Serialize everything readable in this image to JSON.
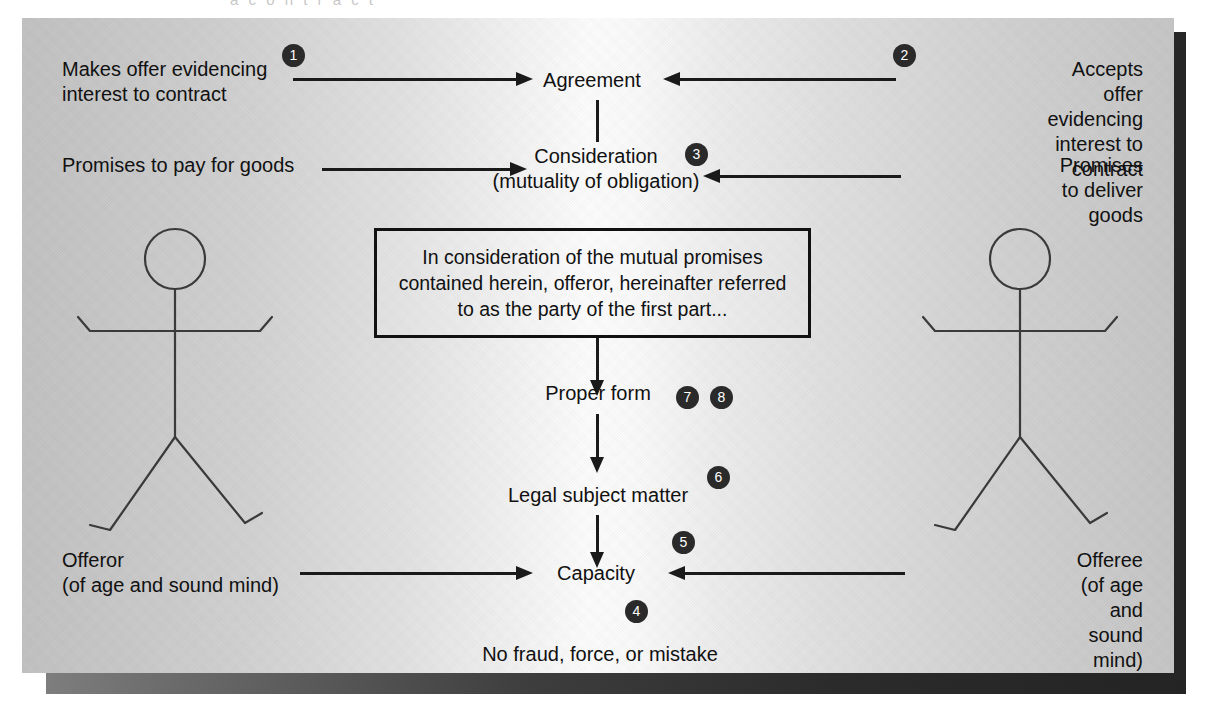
{
  "diagram": {
    "cutoff_text": "a  c  o  n  t  r  a  c  t",
    "center_nodes": [
      {
        "id": "agreement",
        "label": "Agreement"
      },
      {
        "id": "consideration",
        "label": "Consideration\n(mutuality of obligation)"
      },
      {
        "id": "proper-form",
        "label": "Proper form"
      },
      {
        "id": "legal-subject-matter",
        "label": "Legal subject matter"
      },
      {
        "id": "capacity",
        "label": "Capacity"
      },
      {
        "id": "no-fraud",
        "label": "No fraud, force, or mistake"
      }
    ],
    "left_labels": [
      {
        "id": "makes-offer",
        "label": "Makes offer evidencing\ninterest to contract"
      },
      {
        "id": "promises-to-pay",
        "label": "Promises to pay for goods"
      },
      {
        "id": "offeror",
        "label": "Offeror\n(of age and sound mind)"
      }
    ],
    "right_labels": [
      {
        "id": "accepts-offer",
        "label": "Accepts offer evidencing\ninterest to contract"
      },
      {
        "id": "promises-to-deliver",
        "label": "Promises to deliver goods"
      },
      {
        "id": "offeree",
        "label": "Offeree\n(of age and sound mind)"
      }
    ],
    "contract_box": {
      "text": "In consideration of the mutual promises\ncontained herein, offeror, hereinafter referred\nto as the party of the first part..."
    },
    "badges": [
      {
        "id": "badge-1",
        "number": "1"
      },
      {
        "id": "badge-2",
        "number": "2"
      },
      {
        "id": "badge-3",
        "number": "3"
      },
      {
        "id": "badge-4",
        "number": "4"
      },
      {
        "id": "badge-5",
        "number": "5"
      },
      {
        "id": "badge-6",
        "number": "6"
      },
      {
        "id": "badge-7",
        "number": "7"
      },
      {
        "id": "badge-8",
        "number": "8"
      }
    ],
    "figures": [
      {
        "id": "offeror-figure",
        "side": "left"
      },
      {
        "id": "offeree-figure",
        "side": "right"
      }
    ],
    "colors": {
      "ink": "#111111",
      "badge_fill": "#2a2a2a",
      "badge_text": "#ffffff",
      "panel_light": "#fdfdfd",
      "panel_dark": "#c2c2c2",
      "shadow": "#2b2b2b"
    }
  }
}
